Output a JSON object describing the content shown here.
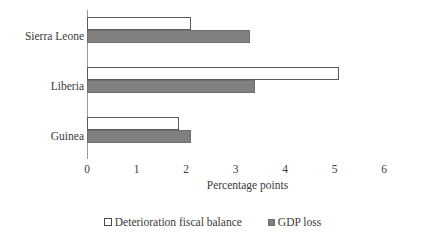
{
  "chart_data": {
    "type": "bar",
    "orientation": "horizontal",
    "title": "",
    "xlabel": "Percentage points",
    "ylabel": "",
    "xlim": [
      0,
      6
    ],
    "xticks": [
      "0",
      "1",
      "2",
      "3",
      "4",
      "5",
      "6"
    ],
    "grid": false,
    "legend_position": "bottom",
    "categories": [
      "Sierra Leone",
      "Liberia",
      "Guinea"
    ],
    "series": [
      {
        "name": "Deterioration fiscal balance",
        "color": "#ffffff",
        "edge_color": "#5a5a5a",
        "values": [
          2.1,
          5.1,
          1.85
        ]
      },
      {
        "name": "GDP loss",
        "color": "#808080",
        "edge_color": "#6e6e6e",
        "values": [
          3.3,
          3.4,
          2.1
        ]
      }
    ]
  },
  "axis": {
    "origin_x_px": 87,
    "px_per_unit": 49.5
  },
  "legend": {
    "items": [
      {
        "label": "Deterioration fiscal balance",
        "swatch": "open-square-marker"
      },
      {
        "label": "GDP loss",
        "swatch": "filled-square-marker"
      }
    ]
  }
}
